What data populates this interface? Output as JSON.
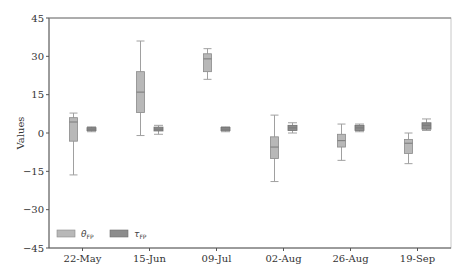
{
  "chart_data": {
    "type": "box",
    "title": "",
    "xlabel": "",
    "ylabel": "Values",
    "ylim": [
      -45,
      45
    ],
    "yticks": [
      -45,
      -30,
      -15,
      0,
      15,
      30,
      45
    ],
    "grid": false,
    "legend_position": "lower left",
    "categories": [
      "22-May",
      "15-Jun",
      "09-Jul",
      "02-Aug",
      "26-Aug",
      "19-Sep"
    ],
    "series": [
      {
        "name": "θ_FP",
        "label_main": "θ",
        "label_sub": "FP",
        "color": "#b8b8b8",
        "edge_color": "#8a8a8a",
        "boxes": [
          {
            "whisker_low": -16.4,
            "q1": -3.2,
            "median": 4.3,
            "q3": 6.0,
            "whisker_high": 7.8
          },
          {
            "whisker_low": -1.0,
            "q1": 8.0,
            "median": 16.0,
            "q3": 24.0,
            "whisker_high": 36.0
          },
          {
            "whisker_low": 21.0,
            "q1": 24.0,
            "median": 29.0,
            "q3": 31.0,
            "whisker_high": 33.0
          },
          {
            "whisker_low": -19.0,
            "q1": -10.0,
            "median": -5.5,
            "q3": -1.5,
            "whisker_high": 7.0
          },
          {
            "whisker_low": -10.7,
            "q1": -5.5,
            "median": -3.0,
            "q3": -0.5,
            "whisker_high": 3.5
          },
          {
            "whisker_low": -12.0,
            "q1": -8.0,
            "median": -4.0,
            "q3": -2.5,
            "whisker_high": 0.0
          }
        ]
      },
      {
        "name": "τ_FP",
        "label_main": "τ",
        "label_sub": "FP",
        "color": "#8c8c8c",
        "edge_color": "#6e6e6e",
        "boxes": [
          {
            "whisker_low": 0.5,
            "q1": 0.9,
            "median": 1.5,
            "q3": 2.1,
            "whisker_high": 2.4
          },
          {
            "whisker_low": -0.5,
            "q1": 0.8,
            "median": 1.5,
            "q3": 2.3,
            "whisker_high": 3.0
          },
          {
            "whisker_low": 0.5,
            "q1": 0.9,
            "median": 1.5,
            "q3": 2.2,
            "whisker_high": 2.4
          },
          {
            "whisker_low": 0.0,
            "q1": 1.0,
            "median": 2.0,
            "q3": 3.0,
            "whisker_high": 4.0
          },
          {
            "whisker_low": 0.5,
            "q1": 1.0,
            "median": 2.0,
            "q3": 3.0,
            "whisker_high": 3.5
          },
          {
            "whisker_low": 1.0,
            "q1": 1.5,
            "median": 3.0,
            "q3": 4.0,
            "whisker_high": 5.5
          }
        ]
      }
    ]
  }
}
